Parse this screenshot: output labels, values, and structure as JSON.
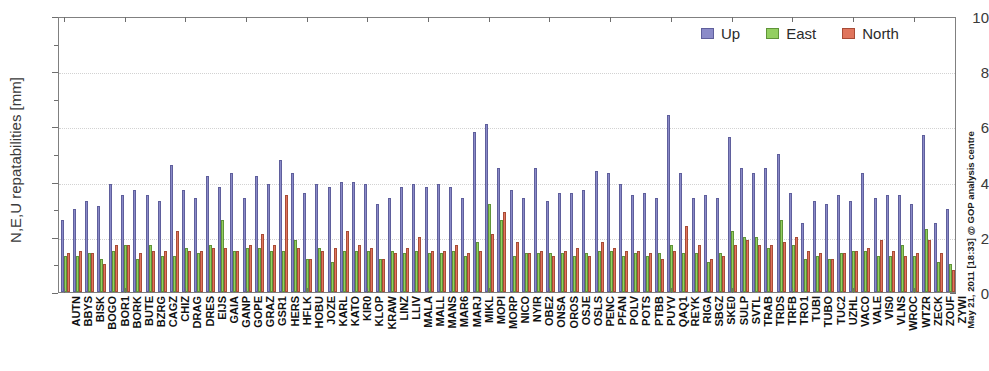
{
  "chart_data": {
    "type": "bar",
    "title": "",
    "xlabel": "",
    "ylabel": "N,E,U repatabilities [mm]",
    "ylim": [
      0,
      10
    ],
    "yticks": [
      0,
      2,
      4,
      6,
      8,
      10
    ],
    "grid": true,
    "legend_position": "top-right",
    "legend": [
      "Up",
      "East",
      "North"
    ],
    "colors": {
      "up": "#8a8ac8",
      "east": "#93cf60",
      "north": "#e0755d"
    },
    "categories": [
      "AUTN",
      "BBYS",
      "BISK",
      "BOGO",
      "BOR1",
      "BORK",
      "BUTE",
      "BZRG",
      "CAGZ",
      "CHIZ",
      "DRAG",
      "DRES",
      "EIJS",
      "GAIA",
      "GANP",
      "GOPE",
      "GRAZ",
      "GSR1",
      "HERS",
      "HFLK",
      "HOBU",
      "JOZE",
      "KARL",
      "KATO",
      "KIR0",
      "KLOP",
      "KRAW",
      "LINZ",
      "LLIV",
      "MALA",
      "MALL",
      "MANS",
      "MAR6",
      "MARJ",
      "MIKL",
      "MOPI",
      "MORP",
      "NICO",
      "NYIR",
      "OBE2",
      "ONSA",
      "OROS",
      "OSJE",
      "OSLS",
      "PENC",
      "PFAN",
      "POLV",
      "POTS",
      "PTBB",
      "PUYV",
      "QAQ1",
      "REYK",
      "RIGA",
      "SBGZ",
      "SKE0",
      "SULP",
      "SVTL",
      "TRAB",
      "TRDS",
      "TRFB",
      "TRO1",
      "TUBI",
      "TUBO",
      "TUC2",
      "UZHL",
      "VACO",
      "VALE",
      "VIS0",
      "VLNS",
      "WROC",
      "WTZR",
      "ZECK",
      "ZOUF",
      "ZYWI"
    ],
    "series": [
      {
        "name": "Up",
        "color": "#8a8ac8",
        "values": [
          2.6,
          3.0,
          3.3,
          3.1,
          3.9,
          3.5,
          3.7,
          3.5,
          3.3,
          4.6,
          3.7,
          3.4,
          4.2,
          3.8,
          4.3,
          3.4,
          4.2,
          3.9,
          4.8,
          4.3,
          3.6,
          3.9,
          3.8,
          4.0,
          4.0,
          3.9,
          3.2,
          3.4,
          3.8,
          3.9,
          3.8,
          3.9,
          3.8,
          3.4,
          5.8,
          6.1,
          4.5,
          3.7,
          3.4,
          4.5,
          3.3,
          3.6,
          3.6,
          3.7,
          4.4,
          4.3,
          3.9,
          3.5,
          3.6,
          3.4,
          6.4,
          4.3,
          3.4,
          3.5,
          3.4,
          5.6,
          4.5,
          4.3,
          4.5,
          5.0,
          3.6,
          2.5,
          3.3,
          3.2,
          3.5,
          3.3,
          4.3,
          3.4,
          3.5,
          3.5,
          3.2,
          5.7,
          2.5,
          3.0
        ]
      },
      {
        "name": "East",
        "color": "#93cf60",
        "values": [
          1.3,
          1.3,
          1.4,
          1.2,
          1.5,
          1.7,
          1.2,
          1.7,
          1.3,
          1.3,
          1.6,
          1.4,
          1.7,
          2.6,
          1.5,
          1.6,
          1.6,
          1.5,
          1.5,
          1.9,
          1.2,
          1.6,
          1.1,
          1.5,
          1.5,
          1.5,
          1.2,
          1.5,
          1.4,
          1.5,
          1.4,
          1.4,
          1.5,
          1.3,
          1.8,
          3.2,
          2.6,
          1.3,
          1.4,
          1.4,
          1.4,
          1.4,
          1.3,
          1.4,
          1.5,
          1.5,
          1.3,
          1.4,
          1.3,
          1.4,
          1.7,
          1.4,
          1.4,
          1.1,
          1.4,
          2.2,
          2.0,
          2.0,
          1.6,
          2.6,
          1.7,
          1.2,
          1.3,
          1.2,
          1.4,
          1.5,
          1.5,
          1.3,
          1.3,
          1.7,
          1.3,
          2.3,
          1.1,
          1.0
        ]
      },
      {
        "name": "North",
        "color": "#e0755d",
        "values": [
          1.4,
          1.5,
          1.4,
          1.0,
          1.7,
          1.7,
          1.4,
          1.5,
          1.5,
          2.2,
          1.5,
          1.5,
          1.6,
          1.6,
          1.5,
          1.7,
          2.1,
          1.7,
          3.5,
          1.6,
          1.2,
          1.5,
          1.6,
          2.2,
          1.7,
          1.6,
          1.2,
          1.4,
          1.6,
          2.0,
          1.5,
          1.5,
          1.7,
          1.4,
          1.5,
          2.1,
          2.9,
          1.8,
          1.4,
          1.5,
          1.3,
          1.5,
          1.6,
          1.3,
          1.8,
          1.6,
          1.5,
          1.5,
          1.4,
          1.2,
          1.5,
          2.4,
          1.7,
          1.2,
          1.3,
          1.7,
          1.9,
          1.7,
          1.7,
          1.8,
          2.0,
          1.5,
          1.4,
          1.2,
          1.4,
          1.5,
          1.6,
          1.9,
          1.5,
          1.3,
          1.4,
          1.9,
          1.4,
          0.8
        ]
      }
    ]
  },
  "credit": {
    "text": "May 21, 2011 [18:33] @ GOP analysis centre"
  }
}
